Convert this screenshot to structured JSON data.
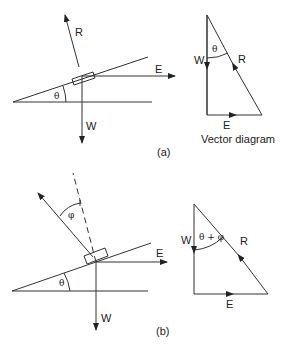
{
  "figure_a": {
    "label": "(a)",
    "force_labels": {
      "R": "R",
      "E": "E",
      "W": "W"
    },
    "angle_label": "θ",
    "vector_diagram": {
      "caption": "Vector diagram",
      "labels": {
        "W": "W",
        "R": "R",
        "E": "E"
      },
      "angle_label": "θ"
    }
  },
  "figure_b": {
    "label": "(b)",
    "force_labels": {
      "E": "E",
      "W": "W"
    },
    "angle_theta": "θ",
    "angle_phi": "φ",
    "vector_diagram": {
      "labels": {
        "W": "W",
        "R": "R",
        "E": "E"
      },
      "angle_label": "θ + φ"
    }
  }
}
